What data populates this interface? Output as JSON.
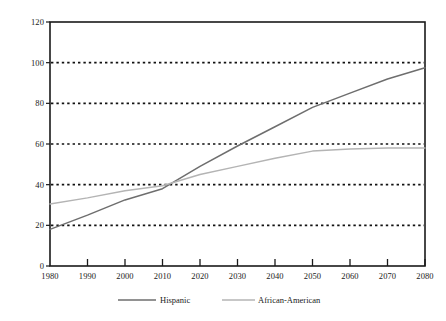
{
  "chart_data": {
    "type": "line",
    "title": "",
    "subtitle": "",
    "xlabel": "",
    "ylabel": "",
    "x": [
      1980,
      1990,
      2000,
      2010,
      2020,
      2030,
      2040,
      2050,
      2060,
      2070,
      2080
    ],
    "xtick_labels": [
      "1980",
      "1990",
      "2000",
      "2010",
      "2020",
      "2030",
      "2040",
      "2050",
      "2060",
      "2070",
      "2080"
    ],
    "ytick_labels": [
      "0",
      "20",
      "40",
      "60",
      "80",
      "100",
      "120"
    ],
    "yticks": [
      0,
      20,
      40,
      60,
      80,
      100,
      120
    ],
    "xlim": [
      1980,
      2080
    ],
    "ylim": [
      0,
      120
    ],
    "grid": "horizontal-dotted",
    "gridlines": [
      20,
      40,
      60,
      80,
      100
    ],
    "legend_position": "bottom",
    "series": [
      {
        "name": "Hispanic",
        "color": "#6e6e6e",
        "values": [
          18,
          25,
          32.5,
          38,
          49,
          59,
          68.5,
          78,
          85,
          92,
          97.5
        ]
      },
      {
        "name": "African-American",
        "color": "#b4b4b4",
        "values": [
          30.5,
          33.5,
          37,
          39.5,
          45,
          49,
          53,
          56.5,
          57.5,
          58,
          58
        ]
      }
    ]
  },
  "legend": {
    "items": [
      {
        "label": "Hispanic"
      },
      {
        "label": "African-American"
      }
    ]
  },
  "colors": {
    "axis": "#1a1a1a",
    "grid": "#111111",
    "hispanic": "#6e6e6e",
    "african_american": "#b4b4b4",
    "background": "#ffffff"
  }
}
